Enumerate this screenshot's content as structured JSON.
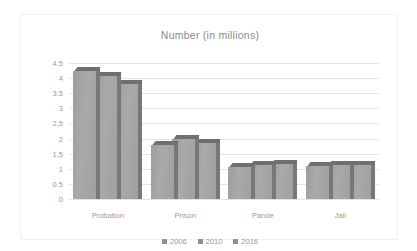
{
  "chart_data": {
    "type": "bar",
    "title": "Number (in millions)",
    "xlabel": "",
    "ylabel": "",
    "ylim": [
      0,
      4.5
    ],
    "ytick_labels": [
      "4.5",
      "4",
      "3.5",
      "3",
      "2.5",
      "2",
      "1.5",
      "1",
      "0.5",
      "0"
    ],
    "ytick_values": [
      4.5,
      4,
      3.5,
      3,
      2.5,
      2,
      1.5,
      1,
      0.5,
      0
    ],
    "grid": true,
    "legend_position": "bottom",
    "categories": [
      "Probation",
      "Prison",
      "Parole",
      "Jail"
    ],
    "series": [
      {
        "name": "2006",
        "values": [
          4.24,
          1.78,
          1.06,
          1.09
        ]
      },
      {
        "name": "2010",
        "values": [
          4.06,
          2.0,
          1.13,
          1.12
        ]
      },
      {
        "name": "2016",
        "values": [
          3.79,
          1.87,
          1.16,
          1.11
        ]
      }
    ]
  },
  "colors": {
    "bar_front": "#a3a3a3",
    "bar_top": "#6f6f6f",
    "bar_side": "#787878",
    "gridline": "#e3e3e3",
    "text": "#9a9a9a",
    "title_text": "#8d8d8d",
    "frame": "#f2f2f2",
    "background": "#ffffff"
  }
}
